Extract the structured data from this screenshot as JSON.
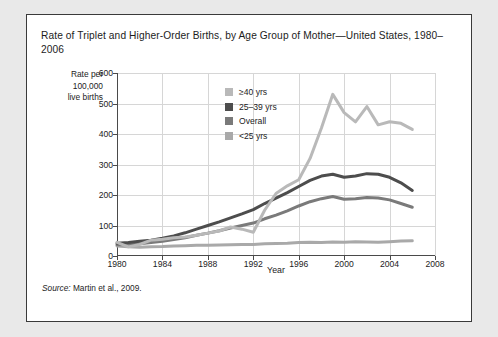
{
  "figure": {
    "title": "Rate of  Triplet and Higher-Order Births, by Age Group of Mother—United States, 1980–2006",
    "source_word": "Source:",
    "source_text": " Martin et al., 2009."
  },
  "chart_data": {
    "type": "line",
    "title": "Rate of  Triplet and Higher-Order Births, by Age Group of Mother—United States, 1980–2006",
    "xlabel": "Year",
    "ylabel": "Rate per 100,000 live births",
    "ylabel_lines": [
      "Rate per",
      "100,000",
      "live births"
    ],
    "xlim": [
      1980,
      2008
    ],
    "ylim": [
      0,
      600
    ],
    "xticks": [
      1980,
      1984,
      1988,
      1992,
      1996,
      2000,
      2004,
      2008
    ],
    "yticks": [
      0,
      100,
      200,
      300,
      400,
      500,
      600
    ],
    "grid": true,
    "legend_position": "upper-left-inside",
    "x": [
      1980,
      1981,
      1982,
      1983,
      1984,
      1985,
      1986,
      1987,
      1988,
      1989,
      1990,
      1991,
      1992,
      1993,
      1994,
      1995,
      1996,
      1997,
      1998,
      1999,
      2000,
      2001,
      2002,
      2003,
      2004,
      2005,
      2006
    ],
    "series": [
      {
        "name": "≥40 yrs",
        "color": "#b9b9b9",
        "values": [
          45,
          30,
          38,
          52,
          55,
          60,
          62,
          68,
          75,
          82,
          95,
          88,
          78,
          150,
          205,
          230,
          250,
          320,
          420,
          530,
          470,
          440,
          490,
          430,
          440,
          435,
          415
        ]
      },
      {
        "name": "25–39 yrs",
        "color": "#4d4d4d",
        "values": [
          42,
          44,
          48,
          52,
          58,
          66,
          76,
          88,
          100,
          112,
          125,
          138,
          152,
          172,
          190,
          208,
          228,
          248,
          262,
          268,
          258,
          262,
          270,
          268,
          258,
          240,
          215
        ]
      },
      {
        "name": "Overall",
        "color": "#7a7a7a",
        "values": [
          37,
          38,
          40,
          44,
          48,
          54,
          60,
          68,
          75,
          83,
          92,
          100,
          108,
          122,
          134,
          148,
          164,
          178,
          188,
          195,
          186,
          188,
          192,
          190,
          184,
          172,
          160
        ]
      },
      {
        "name": "<25 yrs",
        "color": "#a9a9a9",
        "values": [
          33,
          30,
          29,
          30,
          31,
          33,
          34,
          35,
          35,
          36,
          37,
          38,
          38,
          40,
          41,
          42,
          44,
          45,
          44,
          46,
          45,
          47,
          46,
          45,
          47,
          49,
          50
        ]
      }
    ]
  },
  "legend": {
    "items": [
      {
        "label": "≥40 yrs",
        "color": "#b9b9b9"
      },
      {
        "label": "25–39 yrs",
        "color": "#4d4d4d"
      },
      {
        "label": "Overall",
        "color": "#7a7a7a"
      },
      {
        "label": "<25 yrs",
        "color": "#a9a9a9"
      }
    ]
  }
}
